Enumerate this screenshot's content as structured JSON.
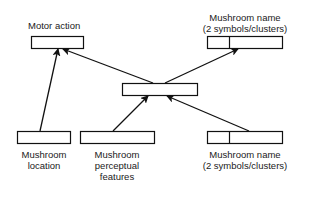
{
  "diagram": {
    "nodes": {
      "motor_action": {
        "label": "Motor action",
        "units": 1
      },
      "name_output": {
        "label": "Mushroom name\n(2 symbols/clusters)",
        "units": 2
      },
      "hidden": {
        "label": "",
        "units": 1
      },
      "location": {
        "label": "Mushroom\nlocation",
        "units": 1
      },
      "perceptual": {
        "label": "Mushroom\nperceptual\nfeatures",
        "units": 1
      },
      "name_input": {
        "label": "Mushroom name\n(2 symbols/clusters)",
        "units": 2
      }
    },
    "edges": [
      {
        "from": "location",
        "to": "motor_action"
      },
      {
        "from": "hidden",
        "to": "motor_action"
      },
      {
        "from": "hidden",
        "to": "name_output"
      },
      {
        "from": "perceptual",
        "to": "hidden"
      },
      {
        "from": "name_input",
        "to": "hidden"
      }
    ],
    "colors": {
      "stroke": "#111111",
      "fill": "#ffffff"
    }
  }
}
